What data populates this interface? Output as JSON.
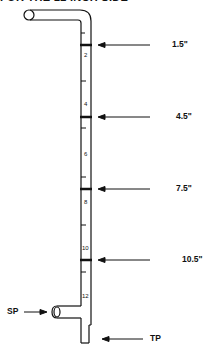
{
  "title": "FOR THE 12 INCH SIDE",
  "scale_numbers": [
    "2",
    "4",
    "6",
    "8",
    "10",
    "12"
  ],
  "depth_markers": [
    {
      "label": "1.5\"",
      "y": 45
    },
    {
      "label": "4.5\"",
      "y": 117
    },
    {
      "label": "7.5\"",
      "y": 189
    },
    {
      "label": "10.5\"",
      "y": 260
    }
  ],
  "port_labels": {
    "side_port": "SP",
    "tip_port": "TP"
  }
}
